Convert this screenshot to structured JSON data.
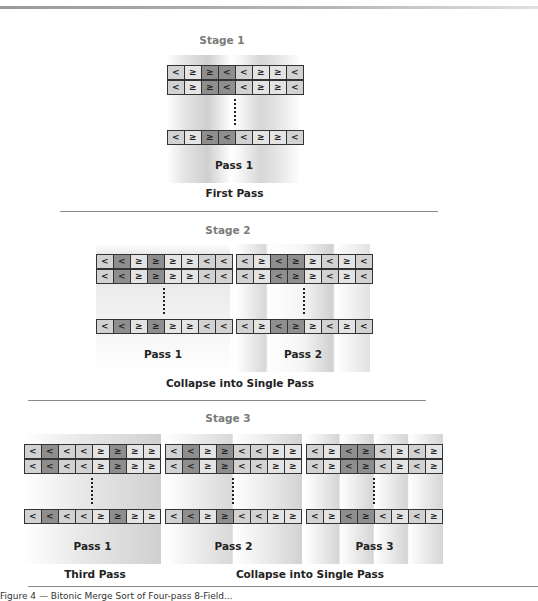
{
  "stages": [
    {
      "label": "Stage 1",
      "caption": "First Pass",
      "groups": [
        {
          "pass_label": "Pass 1",
          "rows": [
            [
              "<",
              "≥",
              "≥",
              "<",
              "<",
              "≥",
              "≥",
              "<"
            ],
            [
              "<",
              "≥",
              "≥",
              "<",
              "<",
              "≥",
              "≥",
              "<"
            ],
            [
              "<",
              "≥",
              "≥",
              "<",
              "<",
              "≥",
              "≥",
              "<"
            ]
          ],
          "dark_cells": [
            2,
            3
          ]
        }
      ]
    },
    {
      "label": "Stage 2",
      "caption": "Collapse into Single Pass",
      "groups": [
        {
          "pass_label": "Pass 1",
          "rows": [
            [
              "<",
              "<",
              "≥",
              "≥",
              "≥",
              "≥",
              "<",
              "<"
            ],
            [
              "<",
              "<",
              "≥",
              "≥",
              "≥",
              "≥",
              "<",
              "<"
            ],
            [
              "<",
              "<",
              "≥",
              "≥",
              "≥",
              "≥",
              "<",
              "<"
            ]
          ],
          "dark_cells": [
            1,
            3
          ]
        },
        {
          "pass_label": "Pass 2",
          "rows": [
            [
              "<",
              "≥",
              "<",
              "≥",
              "≥",
              "<",
              "≥",
              "<"
            ],
            [
              "<",
              "≥",
              "<",
              "≥",
              "≥",
              "<",
              "≥",
              "<"
            ],
            [
              "<",
              "≥",
              "<",
              "≥",
              "≥",
              "<",
              "≥",
              "<"
            ]
          ],
          "dark_cells": [
            2,
            3
          ]
        }
      ]
    },
    {
      "label": "Stage 3",
      "captions": [
        "Third Pass",
        "Collapse into Single Pass"
      ],
      "groups": [
        {
          "pass_label": "Pass 1",
          "rows": [
            [
              "<",
              "<",
              "<",
              "<",
              "≥",
              "≥",
              "≥",
              "≥"
            ],
            [
              "<",
              "<",
              "<",
              "<",
              "≥",
              "≥",
              "≥",
              "≥"
            ],
            [
              "<",
              "<",
              "<",
              "<",
              "≥",
              "≥",
              "≥",
              "≥"
            ]
          ],
          "dark_cells": [
            1,
            5
          ]
        },
        {
          "pass_label": "Pass 2",
          "rows": [
            [
              "<",
              "<",
              "≥",
              "≥",
              "<",
              "<",
              "≥",
              "≥"
            ],
            [
              "<",
              "<",
              "≥",
              "≥",
              "<",
              "<",
              "≥",
              "≥"
            ],
            [
              "<",
              "<",
              "≥",
              "≥",
              "<",
              "<",
              "≥",
              "≥"
            ]
          ],
          "dark_cells": [
            1,
            3
          ]
        },
        {
          "pass_label": "Pass 3",
          "rows": [
            [
              "<",
              "≥",
              "<",
              "≥",
              "<",
              "≥",
              "<",
              "≥"
            ],
            [
              "<",
              "≥",
              "<",
              "≥",
              "<",
              "≥",
              "<",
              "≥"
            ],
            [
              "<",
              "≥",
              "<",
              "≥",
              "<",
              "≥",
              "<",
              "≥"
            ]
          ],
          "dark_cells": [
            2,
            3
          ]
        }
      ]
    }
  ],
  "figure_caption": "Figure 4 — Bitonic Merge Sort of Four-pass 8-Field..."
}
